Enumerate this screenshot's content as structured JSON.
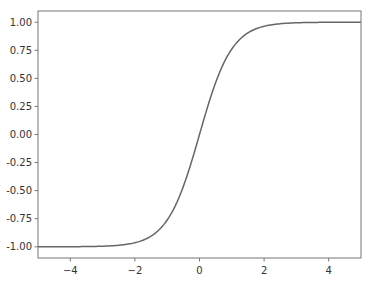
{
  "chart_data": {
    "type": "line",
    "title": "",
    "xlabel": "",
    "ylabel": "",
    "xlim": [
      -5,
      5
    ],
    "ylim": [
      -1.1,
      1.1
    ],
    "grid": false,
    "legend": null,
    "x_ticks": [
      -4,
      -2,
      0,
      2,
      4
    ],
    "x_tick_labels": [
      "−4",
      "−2",
      "0",
      "2",
      "4"
    ],
    "y_ticks": [
      1.0,
      0.75,
      0.5,
      0.25,
      0.0,
      -0.25,
      -0.5,
      -0.75,
      -1.0
    ],
    "y_tick_labels": [
      "1.00",
      "0.75",
      "0.50",
      "0.25",
      "0.00",
      "-0.25",
      "-0.50",
      "-0.75",
      "-1.00"
    ],
    "series": [
      {
        "name": "tanh(x)",
        "function": "tanh",
        "color": "#666666",
        "x": [
          -5,
          -4,
          -3,
          -2.5,
          -2,
          -1.5,
          -1,
          -0.5,
          0,
          0.5,
          1,
          1.5,
          2,
          2.5,
          3,
          4,
          5
        ],
        "y": [
          -0.9999,
          -0.9993,
          -0.9951,
          -0.9866,
          -0.964,
          -0.9051,
          -0.7616,
          -0.4621,
          0,
          0.4621,
          0.7616,
          0.9051,
          0.964,
          0.9866,
          0.9951,
          0.9993,
          0.9999
        ]
      }
    ]
  },
  "style": {
    "axis_color": "#777777",
    "line_color": "#666666",
    "text_color": "#333333"
  }
}
